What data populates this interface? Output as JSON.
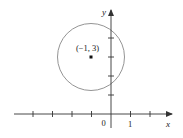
{
  "figure": {
    "type": "coordinate-plane-circle",
    "colors": {
      "axis": "#333333",
      "circle": "#888888",
      "point": "#111111",
      "text": "#222222",
      "background": "#ffffff"
    },
    "axes": {
      "x_label": "x",
      "y_label": "y",
      "origin_label": "0",
      "x_tick_label": "1",
      "x_ticks": [
        -4,
        -3,
        -2,
        -1,
        1,
        2
      ],
      "y_ticks": [
        1,
        2,
        3,
        4
      ]
    },
    "circle": {
      "center": [
        -1,
        3
      ],
      "radius_units": 1.7
    },
    "point": {
      "label": "(−1, 3)",
      "coords": [
        -1,
        3
      ]
    }
  }
}
